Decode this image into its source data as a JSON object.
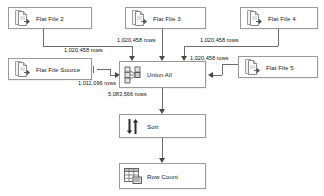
{
  "diagram": {
    "type": "ssis-data-flow",
    "nodes": [
      {
        "id": "ff2",
        "label": "Flat File 2",
        "icon": "flat-file-source-icon"
      },
      {
        "id": "ff3",
        "label": "Flat File 3",
        "icon": "flat-file-source-icon"
      },
      {
        "id": "ff4",
        "label": "Flat File 4",
        "icon": "flat-file-source-icon"
      },
      {
        "id": "ffsource",
        "label": "Flat File Source",
        "icon": "flat-file-source-icon"
      },
      {
        "id": "ff5",
        "label": "Flat File 5",
        "icon": "flat-file-source-icon"
      },
      {
        "id": "unionall",
        "label": "Union All",
        "icon": "union-all-icon"
      },
      {
        "id": "sort",
        "label": "Sort",
        "icon": "sort-icon"
      },
      {
        "id": "rowcount",
        "label": "Row Count",
        "icon": "row-count-icon"
      }
    ],
    "edges": [
      {
        "id": "e-ff2",
        "from": "ff2",
        "to": "unionall",
        "label": "1,020,458 rows"
      },
      {
        "id": "e-ff3",
        "from": "ff3",
        "to": "unionall",
        "label": "1,020,458 rows"
      },
      {
        "id": "e-ff4",
        "from": "ff4",
        "to": "unionall",
        "label": "1,020,458 rows"
      },
      {
        "id": "e-ff5",
        "from": "ff5",
        "to": "unionall",
        "label": "1,020,458 rows"
      },
      {
        "id": "e-source",
        "from": "ffsource",
        "to": "unionall",
        "label": "1,011,096 rows"
      },
      {
        "id": "e-union",
        "from": "unionall",
        "to": "sort",
        "label": "5,083,566 rows"
      },
      {
        "id": "e-sort",
        "from": "sort",
        "to": "rowcount",
        "label": ""
      }
    ],
    "colors": {
      "box_border": "#9a9a9a",
      "box_fill": "#ffffff",
      "wire": "#6d6d6d",
      "arrow": "#4a4a4a",
      "text": "#111111",
      "canvas": "#ffffff"
    }
  }
}
